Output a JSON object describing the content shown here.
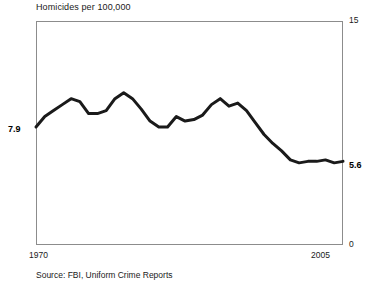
{
  "chart_data": {
    "type": "line",
    "title": "Homicides per 100,000",
    "xlabel": "",
    "ylabel": "",
    "xlim": [
      1970,
      2005
    ],
    "ylim": [
      0,
      15
    ],
    "grid": false,
    "legend": "none",
    "x_tick_labels": [
      "1970",
      "2005"
    ],
    "y_tick_labels": [
      "0",
      "15"
    ],
    "annotations": [
      {
        "name": "start-value",
        "text": "7.9",
        "x": 1970,
        "y": 7.9,
        "position": "left"
      },
      {
        "name": "end-value",
        "text": "5.6",
        "x": 2005,
        "y": 5.6,
        "position": "right"
      }
    ],
    "source": "Source: FBI, Uniform Crime Reports",
    "series": [
      {
        "name": "Homicide rate",
        "color": "#1a1a1a",
        "x": [
          1970,
          1971,
          1972,
          1973,
          1974,
          1975,
          1976,
          1977,
          1978,
          1979,
          1980,
          1981,
          1982,
          1983,
          1984,
          1985,
          1986,
          1987,
          1988,
          1989,
          1990,
          1991,
          1992,
          1993,
          1994,
          1995,
          1996,
          1997,
          1998,
          1999,
          2000,
          2001,
          2002,
          2003,
          2004,
          2005
        ],
        "values": [
          7.9,
          8.6,
          9.0,
          9.4,
          9.8,
          9.6,
          8.8,
          8.8,
          9.0,
          9.8,
          10.2,
          9.8,
          9.1,
          8.3,
          7.9,
          7.9,
          8.6,
          8.3,
          8.4,
          8.7,
          9.4,
          9.8,
          9.3,
          9.5,
          9.0,
          8.2,
          7.4,
          6.8,
          6.3,
          5.7,
          5.5,
          5.6,
          5.6,
          5.7,
          5.5,
          5.6
        ]
      }
    ]
  },
  "chart": {
    "title": "Homicides per 100,000",
    "ytick_top": "15",
    "ytick_bottom": "0",
    "xtick_left": "1970",
    "xtick_right": "2005",
    "value_start": "7.9",
    "value_end": "5.6",
    "source": "Source: FBI, Uniform Crime Reports"
  }
}
